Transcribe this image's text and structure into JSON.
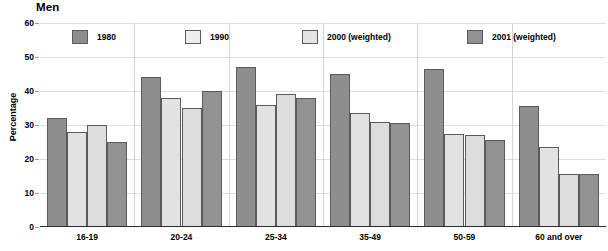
{
  "chart_data": {
    "type": "bar",
    "title": "Men",
    "xlabel": "",
    "ylabel": "Percentage",
    "ylim": [
      0,
      60
    ],
    "yticks": [
      0,
      10,
      20,
      30,
      40,
      50,
      60
    ],
    "grid": true,
    "legend_position": "top",
    "categories": [
      "16-19",
      "20-24",
      "25-34",
      "35-49",
      "50-59",
      "60 and over"
    ],
    "series": [
      {
        "name": "1980",
        "color": "#8e8e8e",
        "values": [
          32,
          44,
          47,
          45,
          46.5,
          35.5
        ]
      },
      {
        "name": "1990",
        "color": "#e2e2e2",
        "values": [
          28,
          38,
          36,
          33.5,
          27.5,
          23.5
        ]
      },
      {
        "name": "2000 (weighted)",
        "color": "#dcdcdc",
        "values": [
          30,
          35,
          39,
          31,
          27,
          15.5
        ]
      },
      {
        "name": "2001 (weighted)",
        "color": "#929292",
        "values": [
          25,
          40,
          38,
          30.5,
          25.5,
          15.5
        ]
      }
    ]
  }
}
